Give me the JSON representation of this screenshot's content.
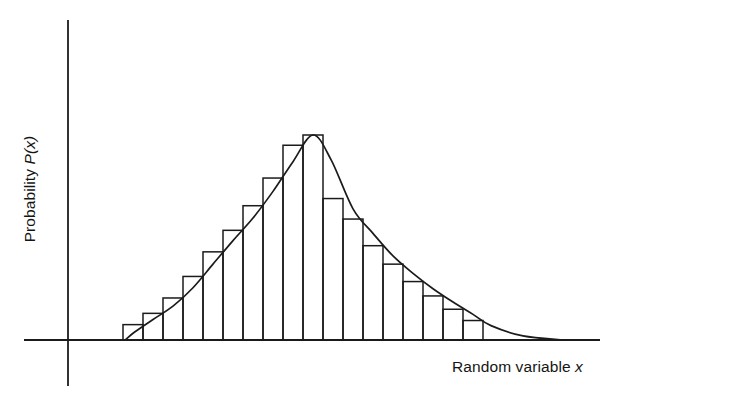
{
  "figure": {
    "background_color": "#ffffff",
    "ink_color": "#1b1b1b"
  },
  "axes": {
    "y_label_prefix": "Probability ",
    "y_label_symbol": "P(x)",
    "x_label_prefix": "Random variable ",
    "x_label_symbol": "x"
  },
  "chart_data": {
    "type": "bar",
    "title": "",
    "subtitle": "",
    "xlabel": "Random variable x",
    "ylabel": "Probability P(x)",
    "grid": false,
    "legend": null,
    "axis_ticks": {
      "x": [],
      "y": []
    },
    "xlim": [
      0,
      24
    ],
    "ylim": [
      0,
      1
    ],
    "categories": [
      "1",
      "2",
      "3",
      "4",
      "5",
      "6",
      "7",
      "8",
      "9",
      "10",
      "11",
      "12",
      "13",
      "14",
      "15",
      "16",
      "17",
      "18"
    ],
    "values": [
      0.075,
      0.13,
      0.205,
      0.31,
      0.43,
      0.535,
      0.655,
      0.79,
      0.95,
      1.0,
      0.69,
      0.59,
      0.46,
      0.37,
      0.285,
      0.215,
      0.15,
      0.095
    ],
    "series": [
      {
        "name": "Histogram bars",
        "type": "bar",
        "values": [
          0.075,
          0.13,
          0.205,
          0.31,
          0.43,
          0.535,
          0.655,
          0.79,
          0.95,
          1.0,
          0.69,
          0.59,
          0.46,
          0.37,
          0.285,
          0.215,
          0.15,
          0.095
        ]
      },
      {
        "name": "Fitted probability curve",
        "type": "line",
        "x": [
          0.1,
          0.6,
          1.5,
          2.5,
          3.5,
          4.5,
          5.5,
          6.5,
          7.5,
          8.5,
          9.5,
          10.4,
          11.5,
          12.5,
          13.5,
          14.5,
          15.5,
          16.5,
          17.5,
          18.4,
          20.0,
          22.0
        ],
        "values": [
          0.0,
          0.04,
          0.1,
          0.165,
          0.255,
          0.37,
          0.485,
          0.595,
          0.725,
          0.87,
          1.0,
          0.88,
          0.64,
          0.52,
          0.41,
          0.325,
          0.25,
          0.185,
          0.125,
          0.07,
          0.02,
          0.0
        ]
      }
    ]
  }
}
